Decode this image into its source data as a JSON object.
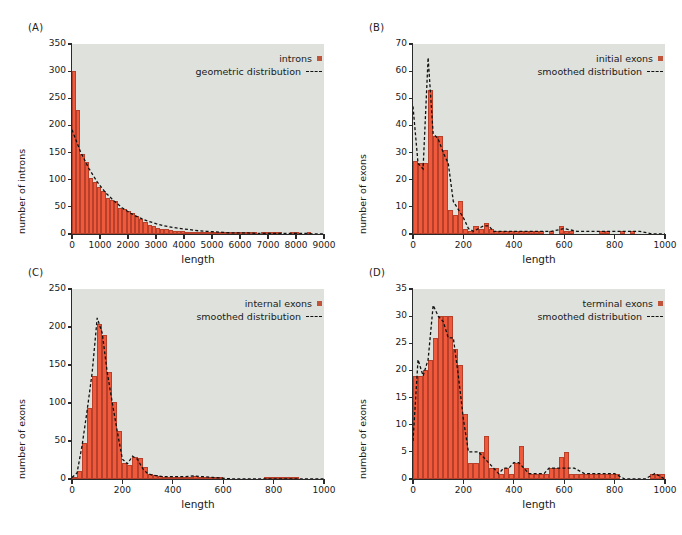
{
  "figure": {
    "background": "#ffffff",
    "plot_background": "#dfe2dc",
    "bar_color": "#f05a3c",
    "bar_edge_color": "#b8402a",
    "curve_color": "#111111",
    "legend_swatch_color": "#c0543a"
  },
  "panels": [
    {
      "letter": "(A)",
      "chart_data": {
        "type": "bar",
        "title": "",
        "xlabel": "length",
        "ylabel": "number of introns",
        "xlim": [
          0,
          9000
        ],
        "ylim": [
          0,
          350
        ],
        "xticks": [
          0,
          1000,
          2000,
          3000,
          4000,
          5000,
          6000,
          7000,
          8000,
          9000
        ],
        "yticks": [
          0,
          50,
          100,
          150,
          200,
          250,
          300,
          350
        ],
        "grid": false,
        "bin_width": 150,
        "legend_position": "top-right",
        "legend": [
          {
            "label": "introns",
            "marker": "square"
          },
          {
            "label": "geometric distribution",
            "marker": "dashed-line"
          }
        ],
        "series": [
          {
            "name": "introns",
            "bin_starts": [
              0,
              150,
              300,
              450,
              600,
              750,
              900,
              1050,
              1200,
              1350,
              1500,
              1650,
              1800,
              1950,
              2100,
              2250,
              2400,
              2550,
              2700,
              2850,
              3000,
              3150,
              3300,
              3450,
              3600,
              3750,
              3900,
              4050,
              4200,
              4350,
              4500,
              4650,
              4800,
              4950,
              5100,
              5250,
              5400,
              5550,
              5700,
              5850,
              6000,
              6150,
              6300,
              6450,
              6600,
              6750,
              6900,
              7050,
              7200,
              7350,
              7500,
              7650,
              7800,
              7950,
              8100,
              8250,
              8400
            ],
            "values": [
              301,
              228,
              148,
              132,
              104,
              95,
              86,
              79,
              66,
              63,
              60,
              48,
              46,
              42,
              38,
              33,
              28,
              22,
              17,
              14,
              12,
              10,
              9,
              7,
              6,
              6,
              5,
              4,
              4,
              4,
              3,
              3,
              3,
              2,
              2,
              2,
              2,
              2,
              1,
              1,
              2,
              2,
              2,
              1,
              0,
              1,
              2,
              2,
              2,
              1,
              0,
              0,
              1,
              1,
              0,
              0,
              1
            ]
          },
          {
            "name": "geometric distribution",
            "style": "dashed",
            "x": [
              0,
              300,
              600,
              900,
              1200,
              1500,
              1800,
              2100,
              2400,
              2700,
              3000,
              3300,
              3600,
              3900,
              4200,
              4500,
              4800,
              5100,
              5400,
              5700,
              6000,
              6300,
              6600,
              6900,
              7200,
              7500,
              7800,
              8100,
              8400,
              8700,
              9000
            ],
            "y": [
              192,
              152,
              121,
              96,
              76,
              61,
              48,
              38,
              30,
              24,
              19,
              15,
              12,
              10,
              8,
              6,
              5,
              4,
              3,
              2,
              2,
              2,
              1,
              1,
              1,
              1,
              1,
              1,
              1,
              0,
              0
            ]
          }
        ]
      }
    },
    {
      "letter": "(B)",
      "chart_data": {
        "type": "bar",
        "title": "",
        "xlabel": "length",
        "ylabel": "number of exons",
        "xlim": [
          0,
          1000
        ],
        "ylim": [
          0,
          70
        ],
        "xticks": [
          0,
          200,
          400,
          600,
          800,
          1000
        ],
        "yticks": [
          0,
          10,
          20,
          30,
          40,
          50,
          60,
          70
        ],
        "grid": false,
        "bin_width": 20,
        "legend_position": "top-right",
        "legend": [
          {
            "label": "initial exons",
            "marker": "square"
          },
          {
            "label": "smoothed distribution",
            "marker": "dashed-line"
          }
        ],
        "series": [
          {
            "name": "initial exons",
            "bin_starts": [
              0,
              20,
              40,
              60,
              80,
              100,
              120,
              140,
              160,
              180,
              200,
              220,
              240,
              260,
              280,
              300,
              320,
              340,
              360,
              380,
              400,
              420,
              440,
              460,
              480,
              500,
              520,
              540,
              560,
              580,
              600,
              620,
              640,
              660,
              680,
              700,
              720,
              740,
              760,
              780,
              800,
              820,
              840,
              860,
              880,
              900,
              920,
              940,
              960,
              980
            ],
            "values": [
              27,
              26,
              26,
              53,
              36,
              36,
              31,
              9,
              7,
              12,
              2,
              1,
              3,
              2,
              4,
              2,
              1,
              1,
              1,
              1,
              1,
              1,
              1,
              1,
              1,
              1,
              0,
              1,
              0,
              3,
              1,
              1,
              0,
              0,
              0,
              0,
              0,
              1,
              1,
              0,
              0,
              1,
              0,
              1,
              0,
              0,
              0,
              0,
              0,
              0
            ]
          },
          {
            "name": "smoothed distribution",
            "style": "dashed",
            "x": [
              0,
              20,
              40,
              60,
              80,
              100,
              120,
              140,
              160,
              180,
              200,
              220,
              240,
              260,
              280,
              300,
              320,
              340,
              360,
              380,
              400,
              450,
              500,
              550,
              600,
              650,
              700,
              750,
              800,
              850,
              900,
              950,
              1000
            ],
            "y": [
              47,
              26,
              24,
              65,
              37,
              35,
              30,
              26,
              12,
              9,
              6,
              2,
              1,
              2,
              3,
              3,
              1,
              1,
              1,
              1,
              1,
              1,
              1,
              1,
              2,
              1,
              1,
              1,
              1,
              1,
              1,
              0,
              0
            ]
          }
        ]
      }
    },
    {
      "letter": "(C)",
      "chart_data": {
        "type": "bar",
        "title": "",
        "xlabel": "length",
        "ylabel": "number of exons",
        "xlim": [
          0,
          1000
        ],
        "ylim": [
          0,
          250
        ],
        "xticks": [
          0,
          200,
          400,
          600,
          800,
          1000
        ],
        "yticks": [
          0,
          50,
          100,
          150,
          200,
          250
        ],
        "grid": false,
        "bin_width": 20,
        "legend_position": "top-right",
        "legend": [
          {
            "label": "internal exons",
            "marker": "square"
          },
          {
            "label": "smoothed distribution",
            "marker": "dashed-line"
          }
        ],
        "series": [
          {
            "name": "internal exons",
            "bin_starts": [
              0,
              20,
              40,
              60,
              80,
              100,
              120,
              140,
              160,
              180,
              200,
              220,
              240,
              260,
              280,
              300,
              320,
              340,
              360,
              380,
              400,
              420,
              440,
              460,
              480,
              500,
              520,
              540,
              560,
              580,
              600,
              620,
              640,
              660,
              680,
              700,
              720,
              740,
              760,
              780,
              800,
              820,
              840,
              860,
              880,
              900,
              920,
              940,
              960,
              980
            ],
            "values": [
              2,
              10,
              48,
              93,
              136,
              204,
              190,
              141,
              101,
              63,
              21,
              18,
              29,
              27,
              16,
              7,
              5,
              4,
              3,
              3,
              2,
              2,
              2,
              3,
              4,
              3,
              2,
              2,
              1,
              1,
              0,
              0,
              0,
              0,
              0,
              0,
              0,
              0,
              1,
              1,
              1,
              1,
              1,
              1,
              1,
              0,
              0,
              0,
              0,
              0
            ]
          },
          {
            "name": "smoothed distribution",
            "style": "dashed",
            "x": [
              0,
              20,
              40,
              60,
              80,
              100,
              120,
              140,
              160,
              180,
              200,
              220,
              240,
              260,
              280,
              300,
              320,
              340,
              360,
              380,
              400,
              440,
              480,
              520,
              560,
              600,
              640,
              680,
              720,
              760,
              800,
              850,
              900,
              950,
              1000
            ],
            "y": [
              2,
              8,
              44,
              90,
              140,
              212,
              192,
              140,
              100,
              62,
              26,
              20,
              30,
              26,
              14,
              7,
              5,
              4,
              3,
              3,
              3,
              3,
              4,
              3,
              2,
              1,
              0,
              0,
              0,
              0,
              0,
              0,
              0,
              0,
              0
            ]
          }
        ]
      }
    },
    {
      "letter": "(D)",
      "chart_data": {
        "type": "bar",
        "title": "",
        "xlabel": "length",
        "ylabel": "number of exons",
        "xlim": [
          0,
          1000
        ],
        "ylim": [
          0,
          35
        ],
        "xticks": [
          0,
          200,
          400,
          600,
          800,
          1000
        ],
        "yticks": [
          0,
          5,
          10,
          15,
          20,
          25,
          30,
          35
        ],
        "grid": false,
        "bin_width": 20,
        "legend_position": "top-right",
        "legend": [
          {
            "label": "terminal exons",
            "marker": "square"
          },
          {
            "label": "smoothed distribution",
            "marker": "dashed-line"
          }
        ],
        "series": [
          {
            "name": "terminal exons",
            "bin_starts": [
              0,
              20,
              40,
              60,
              80,
              100,
              120,
              140,
              160,
              180,
              200,
              220,
              240,
              260,
              280,
              300,
              320,
              340,
              360,
              380,
              400,
              420,
              440,
              460,
              480,
              500,
              520,
              540,
              560,
              580,
              600,
              620,
              640,
              660,
              680,
              700,
              720,
              740,
              760,
              780,
              800,
              820,
              840,
              860,
              880,
              900,
              920,
              940,
              960,
              980
            ],
            "values": [
              19,
              19,
              20,
              22,
              26,
              30,
              30,
              30,
              24,
              21,
              12,
              3,
              3,
              5,
              8,
              2,
              2,
              1,
              2,
              1,
              3,
              6,
              2,
              1,
              1,
              1,
              1,
              2,
              2,
              4,
              5,
              1,
              1,
              1,
              1,
              1,
              1,
              1,
              1,
              1,
              1,
              0,
              0,
              0,
              0,
              0,
              0,
              1,
              1,
              1
            ]
          },
          {
            "name": "smoothed distribution",
            "style": "dashed",
            "x": [
              0,
              20,
              40,
              60,
              80,
              100,
              120,
              140,
              160,
              180,
              200,
              220,
              240,
              260,
              280,
              300,
              320,
              340,
              360,
              380,
              400,
              420,
              440,
              460,
              480,
              500,
              520,
              540,
              560,
              580,
              600,
              640,
              680,
              720,
              760,
              800,
              840,
              880,
              920,
              960,
              1000
            ],
            "y": [
              7,
              22,
              19,
              22,
              32,
              30,
              29,
              26,
              26,
              19,
              11,
              5,
              5,
              5,
              4,
              3,
              2,
              1,
              2,
              2,
              3,
              3,
              2,
              1,
              1,
              1,
              1,
              2,
              2,
              2,
              2,
              2,
              1,
              1,
              1,
              1,
              0,
              0,
              0,
              1,
              0
            ]
          }
        ]
      }
    }
  ]
}
